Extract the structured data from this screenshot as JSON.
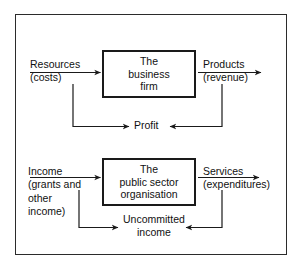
{
  "diagram": {
    "border_color": "#2b2b2b",
    "line_color": "#1a1a1a",
    "background": "#ffffff",
    "panels": [
      {
        "id": "business",
        "box_label_line1": "The",
        "box_label_line2": "business",
        "box_label_line3": "firm",
        "input_line1": "Resources",
        "input_line2": "(costs)",
        "output_line1": "Products",
        "output_line2": "(revenue)",
        "feedback_label": "Profit"
      },
      {
        "id": "public-sector",
        "box_label_line1": "The",
        "box_label_line2": "public sector",
        "box_label_line3": "organisation",
        "input_line1": "Income",
        "input_line2": "(grants and",
        "input_line3": "other",
        "input_line4": "income)",
        "output_line1": "Services",
        "output_line2": "(expenditures)",
        "feedback_line1": "Uncommitted",
        "feedback_line2": "income"
      }
    ]
  }
}
